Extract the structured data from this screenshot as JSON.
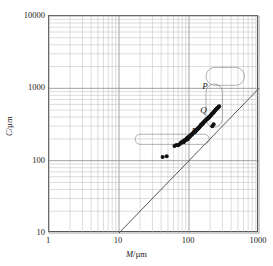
{
  "chart_data": {
    "type": "scatter",
    "title": "",
    "xlabel": "M/µm",
    "ylabel": "C/µm",
    "xscale": "log",
    "yscale": "log",
    "xlim": [
      1,
      1000
    ],
    "ylim": [
      10,
      10000
    ],
    "xticks": [
      "1",
      "10",
      "100",
      "1000"
    ],
    "xtick_values": [
      1,
      10,
      100,
      1000
    ],
    "yticks": [
      "10",
      "100",
      "1000",
      "10000"
    ],
    "ytick_values": [
      10,
      100,
      1000,
      10000
    ],
    "grid": true,
    "grid_minor": true,
    "legend": "none",
    "marker": "filled-circle",
    "marker_color": "#111111",
    "series": [
      {
        "name": "measurements",
        "x": [
          42,
          48,
          62,
          66,
          70,
          74,
          76,
          78,
          80,
          82,
          84,
          86,
          88,
          90,
          92,
          94,
          96,
          98,
          100,
          102,
          104,
          106,
          108,
          110,
          112,
          114,
          116,
          118,
          120,
          122,
          124,
          126,
          128,
          130,
          132,
          134,
          136,
          138,
          140,
          142,
          144,
          146,
          148,
          150,
          152,
          155,
          158,
          160,
          162,
          165,
          168,
          170,
          172,
          175,
          178,
          180,
          183,
          186,
          190,
          193,
          196,
          200,
          204,
          208,
          212,
          216,
          220,
          224,
          228,
          232,
          236,
          240,
          245,
          250,
          255,
          260,
          265,
          270,
          215,
          225
        ],
        "y": [
          112,
          115,
          160,
          165,
          163,
          170,
          175,
          178,
          182,
          185,
          180,
          190,
          195,
          192,
          200,
          205,
          198,
          210,
          215,
          212,
          220,
          225,
          230,
          228,
          235,
          240,
          245,
          250,
          248,
          255,
          260,
          265,
          262,
          270,
          275,
          280,
          278,
          285,
          290,
          295,
          300,
          305,
          310,
          315,
          320,
          318,
          330,
          335,
          340,
          345,
          350,
          355,
          360,
          365,
          370,
          375,
          380,
          385,
          390,
          400,
          405,
          410,
          420,
          430,
          440,
          450,
          455,
          465,
          475,
          485,
          495,
          505,
          515,
          525,
          535,
          545,
          555,
          565,
          300,
          320
        ]
      }
    ],
    "reference_line": {
      "name": "C = M diagonal",
      "from": [
        10,
        10
      ],
      "to": [
        1000,
        1000
      ],
      "style": "solid",
      "color": "#444444"
    },
    "regions": [
      {
        "label": "P",
        "label_x": 160,
        "label_y": 1000,
        "shape": "capsule",
        "x_range": [
          175,
          620
        ],
        "y_range": [
          1100,
          1950
        ]
      },
      {
        "label": "Q",
        "label_x": 150,
        "label_y": 470,
        "shape": "capsule-tail",
        "x_range": [
          175,
          300
        ],
        "y_range": [
          290,
          1150
        ]
      },
      {
        "label": "R",
        "label_x": 112,
        "label_y": 245,
        "shape": "capsule",
        "x_range": [
          17,
          195
        ],
        "y_range": [
          168,
          232
        ]
      }
    ],
    "annotations": [
      "P",
      "Q",
      "R"
    ]
  },
  "axes": {
    "x_title_symbol": "M",
    "x_title_unit": "/µm",
    "y_title_symbol": "C",
    "y_title_unit": "/µm"
  }
}
